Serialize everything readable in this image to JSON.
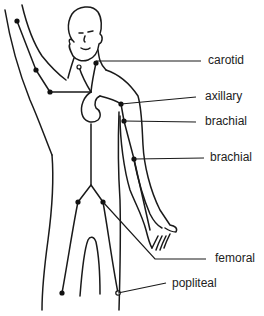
{
  "diagram": {
    "type": "anatomical pulse-point diagram",
    "colors": {
      "line": "#1a1a1a",
      "text": "#222222",
      "background": "#ffffff"
    },
    "labels": {
      "carotid": "carotid",
      "axillary": "axillary",
      "brachial_upper": "brachial",
      "brachial_lower": "brachial",
      "femoral": "femoral",
      "popliteal": "popliteal"
    },
    "pulse_points": [
      {
        "name": "carotid",
        "x": 96,
        "y": 63
      },
      {
        "name": "axillary",
        "x": 121,
        "y": 104
      },
      {
        "name": "brachial",
        "x": 124,
        "y": 121
      },
      {
        "name": "brachial",
        "x": 134,
        "y": 159
      },
      {
        "name": "femoral",
        "x": 103,
        "y": 202
      },
      {
        "name": "popliteal",
        "x": 118,
        "y": 293
      }
    ]
  }
}
